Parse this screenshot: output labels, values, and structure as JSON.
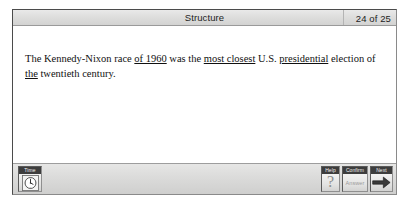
{
  "window": {
    "title": "Structure",
    "page_counter": "24 of 25"
  },
  "question": {
    "segments": [
      {
        "text": "The Kennedy-Nixon race ",
        "underline": false
      },
      {
        "text": "of 1960",
        "underline": true
      },
      {
        "text": " was the ",
        "underline": false
      },
      {
        "text": "most closest",
        "underline": true
      },
      {
        "text": " U.S. ",
        "underline": false
      },
      {
        "text": "presidential",
        "underline": true
      },
      {
        "text": " election of ",
        "underline": false
      },
      {
        "text": "the",
        "underline": true
      },
      {
        "text": " twentieth century.",
        "underline": false
      }
    ],
    "plain_text": "The Kennedy-Nixon race of 1960 was the most closest U.S. presidential election of the twentieth century."
  },
  "toolbar": {
    "time_label": "Time",
    "time_icon": "clock-icon",
    "help_label": "Help",
    "help_glyph": "?",
    "confirm_label": "Confirm",
    "confirm_value": "Answer",
    "next_label": "Next",
    "next_icon": "right-arrow-icon"
  },
  "colors": {
    "window_border": "#4b4b4b",
    "title_bar": "#dedede",
    "toolbar": "#dcdcdb",
    "button_cap": "#3d3d3d",
    "content_background": "#ffffff",
    "text": "#101010",
    "disabled_text": "#9a9a9a"
  }
}
